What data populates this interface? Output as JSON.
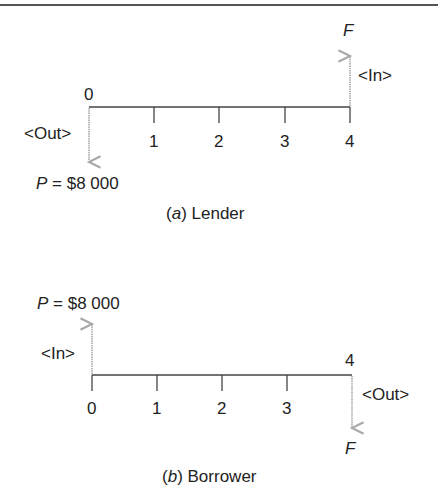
{
  "figure": {
    "colors": {
      "axis": "#444444",
      "arrow": "#a8a8a8",
      "text": "#222222",
      "rule": "#555555"
    },
    "panels": [
      {
        "id": "a",
        "caption_letter": "a",
        "caption_text": " Lender",
        "periods": [
          "0",
          "1",
          "2",
          "3",
          "4"
        ],
        "p_symbol": "P",
        "p_value": " = $8 000",
        "f_symbol": "F",
        "out_label": "<Out>",
        "in_label": "<In>",
        "flows": [
          {
            "period": 0,
            "label": "P = $8 000",
            "direction": "down",
            "type": "Out"
          },
          {
            "period": 4,
            "label": "F",
            "direction": "up",
            "type": "In"
          }
        ]
      },
      {
        "id": "b",
        "caption_letter": "b",
        "caption_text": " Borrower",
        "periods": [
          "0",
          "1",
          "2",
          "3",
          "4"
        ],
        "p_symbol": "P",
        "p_value": " = $8 000",
        "f_symbol": "F",
        "in_label": "<In>",
        "out_label": "<Out>",
        "flows": [
          {
            "period": 0,
            "label": "P = $8 000",
            "direction": "up",
            "type": "In"
          },
          {
            "period": 4,
            "label": "F",
            "direction": "down",
            "type": "Out"
          }
        ]
      }
    ]
  }
}
